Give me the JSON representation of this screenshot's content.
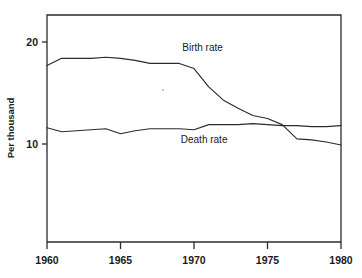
{
  "chart_data": {
    "type": "line",
    "title": "",
    "subtitle": "",
    "xlabel": "",
    "ylabel": "Per thousand",
    "xlim": [
      1960,
      1980
    ],
    "ylim": [
      3.0,
      21.3
    ],
    "grid": false,
    "legend_position": "inline-annotations",
    "x_ticks": [
      "1960",
      "1965",
      "1970",
      "1975",
      "1980"
    ],
    "x_tick_values": [
      1960,
      1965,
      1970,
      1975,
      1980
    ],
    "y_ticks": [
      "20",
      "10"
    ],
    "y_tick_values": [
      20,
      10
    ],
    "x": [
      1960,
      1961,
      1962,
      1963,
      1964,
      1965,
      1966,
      1967,
      1968,
      1969,
      1970,
      1971,
      1972,
      1973,
      1974,
      1975,
      1976,
      1977,
      1978,
      1979,
      1980
    ],
    "series": [
      {
        "name": "Birth rate",
        "label": "Birth rate",
        "values": [
          17.7,
          18.4,
          18.4,
          18.4,
          18.5,
          18.4,
          18.2,
          17.9,
          17.9,
          17.9,
          17.4,
          15.6,
          14.3,
          13.5,
          12.8,
          12.5,
          11.9,
          10.5,
          10.4,
          10.2,
          9.9
        ]
      },
      {
        "name": "Death rate",
        "label": "Death rate",
        "values": [
          11.6,
          11.2,
          11.3,
          11.4,
          11.5,
          11.0,
          11.3,
          11.5,
          11.5,
          11.5,
          11.4,
          11.9,
          11.9,
          11.9,
          12.0,
          11.9,
          11.8,
          11.8,
          11.7,
          11.7,
          11.8
        ]
      }
    ],
    "annotations": [
      {
        "text": "Birth rate",
        "x": 1969.2,
        "y": 19.1
      },
      {
        "text": "Death rate",
        "x": 1969.1,
        "y": 10.1
      }
    ],
    "colors": {
      "line": "#2b2b2b",
      "axis": "#2b2b2b",
      "background": "#ffffff",
      "text": "#1a1a1a"
    }
  }
}
